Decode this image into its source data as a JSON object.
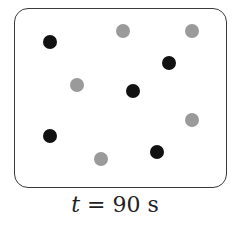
{
  "diagram": {
    "caption": {
      "variable": "t",
      "equals": " = ",
      "value": "90 s"
    },
    "colors": {
      "dark": "#111111",
      "light": "#9a9a9a",
      "border": "#3a3a3a"
    },
    "particles": [
      {
        "type": "dark",
        "x": 50,
        "y": 42
      },
      {
        "type": "light",
        "x": 123,
        "y": 31
      },
      {
        "type": "light",
        "x": 192,
        "y": 31
      },
      {
        "type": "dark",
        "x": 169,
        "y": 63
      },
      {
        "type": "light",
        "x": 77,
        "y": 85
      },
      {
        "type": "dark",
        "x": 133,
        "y": 91
      },
      {
        "type": "light",
        "x": 192,
        "y": 120
      },
      {
        "type": "dark",
        "x": 50,
        "y": 136
      },
      {
        "type": "dark",
        "x": 157,
        "y": 152
      },
      {
        "type": "light",
        "x": 101,
        "y": 159
      }
    ]
  }
}
